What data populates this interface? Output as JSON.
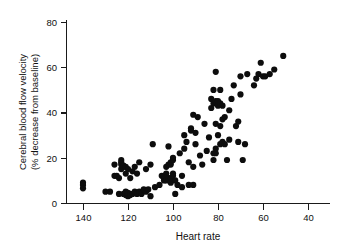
{
  "chart_data": {
    "type": "scatter",
    "title": "",
    "xlabel": "Heart rate",
    "ylabel": "Cerebral blood flow velocity (% decrease from baseline)",
    "ylabel_line1": "Cerebral blood flow velocity",
    "ylabel_line2": "(% decrease from baseline)",
    "xlim": [
      145,
      35
    ],
    "ylim": [
      0,
      84
    ],
    "x_reversed": true,
    "grid": false,
    "legend": "none",
    "xticks": [
      140,
      120,
      100,
      80,
      60,
      40
    ],
    "xtick_labels": [
      "140",
      "120",
      "100",
      "80",
      "60",
      "40"
    ],
    "yticks": [
      0,
      20,
      40,
      60,
      80
    ],
    "ytick_labels": [
      "0",
      "20",
      "40",
      "60",
      "80"
    ],
    "marker": "filled-circle",
    "marker_color": "#0d0d0d",
    "marker_size": 4.2,
    "points": [
      [
        140,
        9
      ],
      [
        140,
        8
      ],
      [
        140,
        6.5
      ],
      [
        130,
        5
      ],
      [
        128,
        5
      ],
      [
        126,
        12
      ],
      [
        126,
        17
      ],
      [
        125,
        12
      ],
      [
        124,
        4
      ],
      [
        124,
        11
      ],
      [
        123,
        15
      ],
      [
        123,
        17
      ],
      [
        123,
        18
      ],
      [
        123,
        19
      ],
      [
        122,
        4
      ],
      [
        122,
        16
      ],
      [
        122,
        16.5
      ],
      [
        121,
        3.5
      ],
      [
        121,
        4.5
      ],
      [
        121,
        5
      ],
      [
        121,
        13
      ],
      [
        121,
        16
      ],
      [
        120,
        3
      ],
      [
        120,
        3.5
      ],
      [
        120,
        4
      ],
      [
        120,
        4.5
      ],
      [
        120,
        15
      ],
      [
        119,
        3.5
      ],
      [
        119,
        4
      ],
      [
        119,
        11
      ],
      [
        118,
        4
      ],
      [
        118,
        14
      ],
      [
        117,
        5
      ],
      [
        117,
        16
      ],
      [
        116,
        4
      ],
      [
        116,
        13
      ],
      [
        115,
        5
      ],
      [
        115,
        18
      ],
      [
        114,
        4
      ],
      [
        113,
        6
      ],
      [
        112,
        15
      ],
      [
        112,
        5
      ],
      [
        111,
        6
      ],
      [
        110,
        3
      ],
      [
        110,
        17
      ],
      [
        109,
        26
      ],
      [
        108,
        7
      ],
      [
        106,
        8
      ],
      [
        105,
        12
      ],
      [
        104,
        10
      ],
      [
        104,
        11
      ],
      [
        104,
        12
      ],
      [
        103,
        10
      ],
      [
        103,
        13
      ],
      [
        103,
        16
      ],
      [
        102,
        11
      ],
      [
        102,
        17
      ],
      [
        102,
        25
      ],
      [
        101,
        9
      ],
      [
        101,
        11
      ],
      [
        101,
        17
      ],
      [
        101,
        18
      ],
      [
        100,
        12
      ],
      [
        100,
        13
      ],
      [
        100,
        19
      ],
      [
        100,
        20
      ],
      [
        99,
        4
      ],
      [
        99,
        10
      ],
      [
        98,
        8
      ],
      [
        97,
        22
      ],
      [
        96,
        7
      ],
      [
        96,
        12
      ],
      [
        95,
        24
      ],
      [
        95,
        30
      ],
      [
        94,
        27
      ],
      [
        93,
        8
      ],
      [
        93,
        18
      ],
      [
        92,
        32
      ],
      [
        92,
        33
      ],
      [
        91,
        8
      ],
      [
        91,
        16
      ],
      [
        91,
        39
      ],
      [
        90,
        26
      ],
      [
        90,
        31
      ],
      [
        89,
        38
      ],
      [
        88,
        21
      ],
      [
        87,
        17
      ],
      [
        86,
        35
      ],
      [
        85,
        23
      ],
      [
        84,
        29
      ],
      [
        83,
        42
      ],
      [
        83,
        46
      ],
      [
        82,
        19
      ],
      [
        82,
        22
      ],
      [
        82,
        44
      ],
      [
        82,
        50
      ],
      [
        81,
        22
      ],
      [
        81,
        24
      ],
      [
        81,
        35
      ],
      [
        81,
        45
      ],
      [
        81,
        58
      ],
      [
        80,
        30
      ],
      [
        80,
        43
      ],
      [
        80,
        45
      ],
      [
        79,
        26
      ],
      [
        79,
        34
      ],
      [
        79,
        44
      ],
      [
        79,
        50
      ],
      [
        78,
        27
      ],
      [
        78,
        37
      ],
      [
        78,
        43
      ],
      [
        77,
        26
      ],
      [
        77,
        38
      ],
      [
        76,
        19
      ],
      [
        75,
        28
      ],
      [
        75,
        41
      ],
      [
        74,
        46
      ],
      [
        73,
        52
      ],
      [
        72,
        34
      ],
      [
        71,
        27
      ],
      [
        71,
        36
      ],
      [
        70,
        48
      ],
      [
        70,
        56
      ],
      [
        69,
        19
      ],
      [
        68,
        26
      ],
      [
        67,
        57
      ],
      [
        64,
        52
      ],
      [
        63,
        55
      ],
      [
        62,
        57
      ],
      [
        61,
        62
      ],
      [
        60,
        56
      ],
      [
        59,
        56
      ],
      [
        57,
        57
      ],
      [
        55,
        59
      ],
      [
        51,
        65
      ]
    ]
  }
}
